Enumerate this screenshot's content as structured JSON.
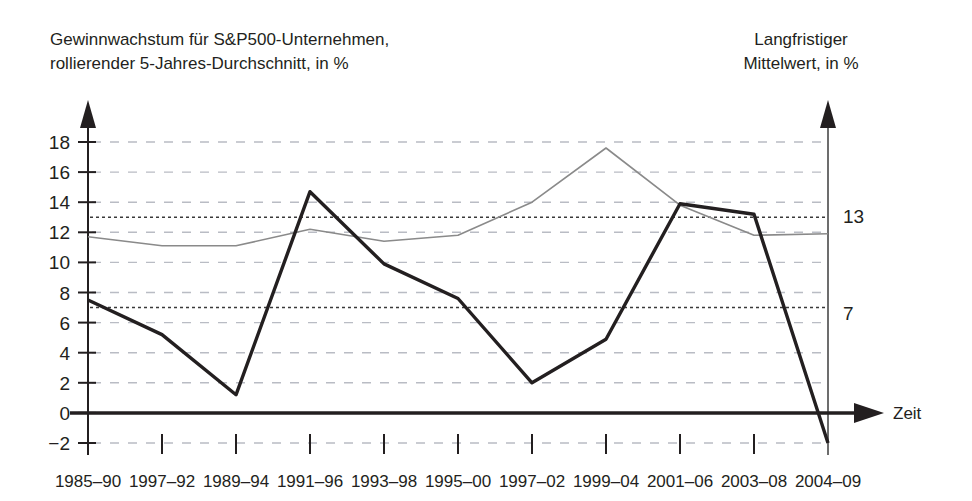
{
  "titles": {
    "left_line1": "Gewinnwachstum für S&P500-Unternehmen,",
    "left_line2": "rollierender 5-Jahres-Durchschnitt, in %",
    "right_line1": "Langfristiger",
    "right_line2": "Mittelwert, in %"
  },
  "axis": {
    "x_axis_label": "Zeit",
    "right_label_13": "13",
    "right_label_7": "7"
  },
  "colors": {
    "series_main": "#231f20",
    "series_average": "#8a8a8a",
    "gridline": "#b9bcc4",
    "reference_line": "#3a3a3a",
    "axis": "#231f20",
    "background": "#ffffff"
  },
  "chart_data": {
    "type": "line",
    "title": "Gewinnwachstum für S&P500-Unternehmen, rollierender 5-Jahres-Durchschnitt, in %",
    "xlabel": "Zeit",
    "ylabel": "",
    "ylim": [
      -2,
      18
    ],
    "yticks": [
      -2,
      0,
      2,
      4,
      6,
      8,
      10,
      12,
      14,
      16,
      18
    ],
    "ytick_labels": [
      "−2",
      "0",
      "2",
      "4",
      "6",
      "8",
      "10",
      "12",
      "14",
      "16",
      "18"
    ],
    "grid": true,
    "legend": "none",
    "categories": [
      "1985–90",
      "1997–92",
      "1989–94",
      "1991–96",
      "1993–98",
      "1995–00",
      "1997–02",
      "1999–04",
      "2001–06",
      "2003–08",
      "2004–09"
    ],
    "series": [
      {
        "name": "Gewinnwachstum (rollierender 5-Jahres-Durchschnitt)",
        "style": "thick-solid",
        "values": [
          7.5,
          5.2,
          1.2,
          14.7,
          9.9,
          7.6,
          2.0,
          4.9,
          13.9,
          13.2,
          -2.0
        ]
      },
      {
        "name": "Langfristiger Mittelwert",
        "style": "thin-solid",
        "values": [
          11.7,
          11.1,
          11.1,
          12.2,
          11.4,
          11.8,
          14.0,
          17.6,
          13.8,
          11.8,
          11.9
        ]
      }
    ],
    "annotations": [
      {
        "label": "13",
        "type": "horizontal-reference-line",
        "value": 13
      },
      {
        "label": "7",
        "type": "horizontal-reference-line",
        "value": 7
      }
    ]
  }
}
